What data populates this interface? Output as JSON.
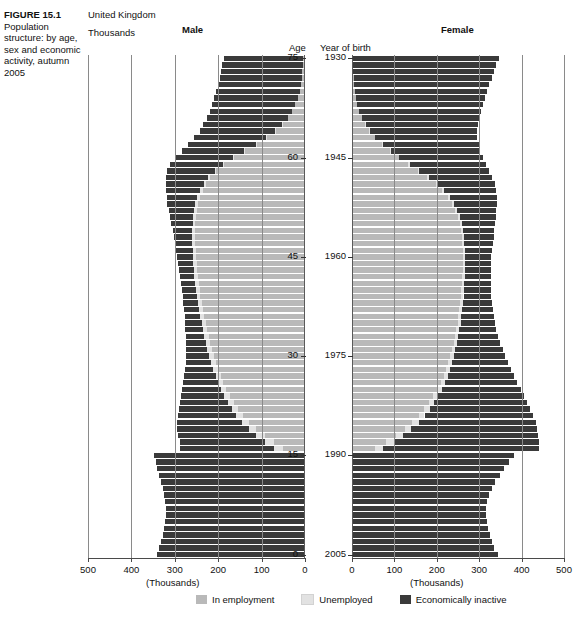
{
  "caption": {
    "figure_number": "FIGURE 15.1",
    "figure_title": "Population structure: by age, sex and economic activity, autumn 2005"
  },
  "header": {
    "country": "United Kingdom",
    "units": "Thousands",
    "male_title": "Male",
    "female_title": "Female",
    "age_header": "Age",
    "year_of_birth_header": "Year of birth"
  },
  "axis": {
    "units_label_male": "(Thousands)",
    "units_label_female": "(Thousands)",
    "male_ticks": [
      "500",
      "400",
      "300",
      "200",
      "100",
      "0"
    ],
    "female_ticks": [
      "0",
      "100",
      "200",
      "300",
      "400",
      "500"
    ],
    "age_ticks": [
      "75",
      "60",
      "45",
      "30",
      "15",
      "0"
    ],
    "year_ticks": [
      "1930",
      "1945",
      "1960",
      "1975",
      "1990",
      "2005"
    ]
  },
  "legend": {
    "items": [
      {
        "label": "In employment",
        "color": "#b9b9b9",
        "key": "in_employment"
      },
      {
        "label": "Unemployed",
        "color": "#e2e2e2",
        "key": "unemployed"
      },
      {
        "label": "Economically inactive",
        "color": "#3a3a3a",
        "key": "economically_inactive"
      }
    ]
  },
  "chart_data": {
    "type": "bar",
    "subtype": "population-pyramid-stacked",
    "title": "Population structure: by age, sex and economic activity, autumn 2005",
    "region": "United Kingdom",
    "xlabel": "(Thousands)",
    "ylabel": "Age",
    "y2label": "Year of birth",
    "xlim": [
      0,
      500
    ],
    "xticks": [
      0,
      100,
      200,
      300,
      400,
      500
    ],
    "grid": true,
    "legend_position": "bottom-center",
    "series_names": [
      "In employment",
      "Unemployed",
      "Economically inactive"
    ],
    "series_colors": [
      "#b9b9b9",
      "#e2e2e2",
      "#3a3a3a"
    ],
    "age_ticks": [
      75,
      60,
      45,
      30,
      15,
      0
    ],
    "year_of_birth_ticks": [
      1930,
      1945,
      1960,
      1975,
      1990,
      2005
    ],
    "units": "thousands",
    "note": "Rows run from age 75+ (top) down to age 0 (bottom); each row = one year of age. Values are [in_employment, unemployed, economically_inactive] in thousands.",
    "ages": [
      75,
      74,
      73,
      72,
      71,
      70,
      69,
      68,
      67,
      66,
      65,
      64,
      63,
      62,
      61,
      60,
      59,
      58,
      57,
      56,
      55,
      54,
      53,
      52,
      51,
      50,
      49,
      48,
      47,
      46,
      45,
      44,
      43,
      42,
      41,
      40,
      39,
      38,
      37,
      36,
      35,
      34,
      33,
      32,
      31,
      30,
      29,
      28,
      27,
      26,
      25,
      24,
      23,
      22,
      21,
      20,
      19,
      18,
      17,
      16,
      15,
      14,
      13,
      12,
      11,
      10,
      9,
      8,
      7,
      6,
      5,
      4,
      3,
      2,
      1,
      0
    ],
    "male": {
      "in_employment": [
        4,
        5,
        6,
        7,
        9,
        12,
        16,
        22,
        30,
        40,
        52,
        68,
        88,
        112,
        138,
        163,
        186,
        204,
        218,
        228,
        236,
        242,
        247,
        250,
        252,
        253,
        254,
        254,
        253,
        252,
        251,
        250,
        249,
        247,
        245,
        243,
        241,
        238,
        235,
        232,
        229,
        226,
        222,
        218,
        214,
        210,
        205,
        200,
        194,
        188,
        181,
        173,
        164,
        154,
        142,
        128,
        112,
        93,
        72,
        50,
        0,
        0,
        0,
        0,
        0,
        0,
        0,
        0,
        0,
        0,
        0,
        0,
        0,
        0,
        0,
        0
      ],
      "unemployed": [
        0,
        0,
        0,
        0,
        0,
        0,
        0,
        0,
        0,
        0,
        1,
        1,
        2,
        2,
        3,
        3,
        4,
        4,
        5,
        5,
        5,
        6,
        6,
        6,
        6,
        6,
        6,
        7,
        7,
        7,
        7,
        7,
        7,
        8,
        8,
        8,
        8,
        9,
        9,
        9,
        9,
        10,
        10,
        10,
        11,
        11,
        11,
        12,
        12,
        13,
        13,
        14,
        14,
        15,
        16,
        17,
        18,
        19,
        20,
        22,
        0,
        0,
        0,
        0,
        0,
        0,
        0,
        0,
        0,
        0,
        0,
        0,
        0,
        0,
        0,
        0
      ],
      "economically_inactive": [
        183,
        186,
        188,
        190,
        192,
        193,
        193,
        192,
        190,
        186,
        181,
        174,
        165,
        155,
        143,
        132,
        120,
        109,
        98,
        88,
        79,
        71,
        64,
        58,
        53,
        49,
        45,
        42,
        40,
        38,
        36,
        35,
        34,
        33,
        33,
        33,
        33,
        34,
        35,
        36,
        38,
        40,
        43,
        46,
        50,
        54,
        59,
        65,
        72,
        80,
        89,
        99,
        110,
        122,
        135,
        149,
        164,
        180,
        197,
        215,
        348,
        344,
        340,
        336,
        332,
        328,
        324,
        322,
        320,
        320,
        322,
        325,
        328,
        332,
        337,
        342
      ],
      "total": [
        187,
        191,
        194,
        197,
        201,
        205,
        209,
        214,
        220,
        226,
        234,
        243,
        255,
        269,
        284,
        298,
        310,
        317,
        321,
        321,
        320,
        319,
        317,
        314,
        311,
        308,
        305,
        303,
        300,
        297,
        294,
        292,
        290,
        288,
        286,
        284,
        282,
        281,
        279,
        277,
        276,
        276,
        275,
        274,
        275,
        275,
        275,
        277,
        278,
        281,
        283,
        286,
        288,
        291,
        293,
        294,
        294,
        292,
        289,
        287,
        348,
        344,
        340,
        336,
        332,
        328,
        324,
        322,
        320,
        320,
        322,
        325,
        328,
        332,
        337,
        342
      ]
    },
    "female": {
      "in_employment": [
        2,
        2,
        3,
        4,
        5,
        7,
        9,
        12,
        17,
        23,
        31,
        41,
        54,
        70,
        89,
        110,
        133,
        156,
        178,
        197,
        213,
        226,
        236,
        244,
        250,
        254,
        257,
        259,
        260,
        261,
        261,
        261,
        261,
        260,
        259,
        258,
        257,
        255,
        253,
        251,
        249,
        246,
        243,
        240,
        236,
        232,
        227,
        222,
        216,
        209,
        201,
        192,
        182,
        170,
        157,
        142,
        124,
        103,
        80,
        55,
        0,
        0,
        0,
        0,
        0,
        0,
        0,
        0,
        0,
        0,
        0,
        0,
        0,
        0,
        0,
        0
      ],
      "unemployed": [
        0,
        0,
        0,
        0,
        0,
        0,
        0,
        0,
        0,
        0,
        1,
        1,
        1,
        2,
        2,
        2,
        3,
        3,
        3,
        4,
        4,
        4,
        4,
        4,
        4,
        5,
        5,
        5,
        5,
        5,
        5,
        5,
        5,
        6,
        6,
        6,
        6,
        6,
        7,
        7,
        7,
        7,
        8,
        8,
        8,
        9,
        9,
        9,
        10,
        10,
        11,
        11,
        12,
        13,
        14,
        15,
        16,
        17,
        18,
        19,
        0,
        0,
        0,
        0,
        0,
        0,
        0,
        0,
        0,
        0,
        0,
        0,
        0,
        0,
        0,
        0
      ],
      "economically_inactive": [
        344,
        338,
        332,
        326,
        319,
        312,
        304,
        296,
        287,
        277,
        266,
        254,
        241,
        227,
        212,
        197,
        181,
        165,
        150,
        136,
        123,
        111,
        101,
        92,
        85,
        79,
        74,
        70,
        67,
        65,
        63,
        62,
        62,
        62,
        63,
        64,
        66,
        69,
        72,
        76,
        81,
        87,
        94,
        102,
        111,
        121,
        132,
        144,
        157,
        171,
        186,
        202,
        219,
        237,
        256,
        276,
        297,
        319,
        342,
        366,
        382,
        370,
        358,
        348,
        338,
        330,
        322,
        318,
        316,
        316,
        318,
        321,
        325,
        330,
        336,
        344
      ],
      "total": [
        346,
        340,
        335,
        330,
        324,
        319,
        313,
        308,
        304,
        300,
        298,
        296,
        296,
        299,
        303,
        309,
        317,
        324,
        331,
        337,
        340,
        341,
        341,
        340,
        339,
        338,
        336,
        334,
        332,
        331,
        329,
        328,
        328,
        328,
        328,
        328,
        329,
        330,
        332,
        334,
        337,
        340,
        345,
        350,
        355,
        362,
        368,
        375,
        383,
        390,
        398,
        405,
        413,
        420,
        427,
        433,
        437,
        439,
        440,
        440,
        382,
        370,
        358,
        348,
        338,
        330,
        322,
        318,
        316,
        316,
        318,
        321,
        325,
        330,
        336,
        344
      ]
    }
  }
}
